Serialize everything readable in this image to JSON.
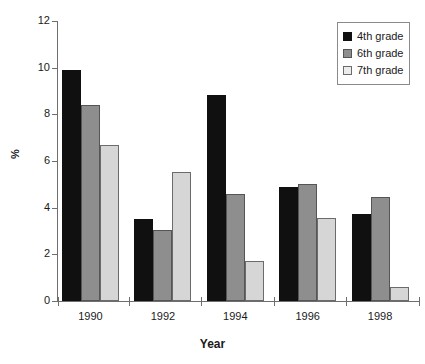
{
  "chart_data": {
    "type": "bar",
    "title": "",
    "xlabel": "Year",
    "ylabel": "%",
    "categories": [
      "1990",
      "1992",
      "1994",
      "1996",
      "1998"
    ],
    "series": [
      {
        "name": "4th grade",
        "color": "#101010",
        "values": [
          9.9,
          3.5,
          8.85,
          4.9,
          3.75
        ]
      },
      {
        "name": "6th grade",
        "color": "#8e8e8e",
        "values": [
          8.4,
          3.05,
          4.6,
          5.0,
          4.45
        ]
      },
      {
        "name": "7th grade",
        "color": "#d6d6d6",
        "values": [
          6.7,
          5.55,
          1.7,
          3.55,
          0.6
        ]
      }
    ],
    "ylim": [
      0,
      12
    ],
    "ytick_labels": [
      "0",
      "2",
      "4",
      "6",
      "8",
      "10",
      "12"
    ],
    "ytick_values": [
      0,
      2,
      4,
      6,
      8,
      10,
      12
    ],
    "grid": false,
    "legend_position": "top-right"
  },
  "legend": {
    "entries": [
      {
        "label": "4th grade"
      },
      {
        "label": "6th grade"
      },
      {
        "label": "7th grade"
      }
    ]
  }
}
